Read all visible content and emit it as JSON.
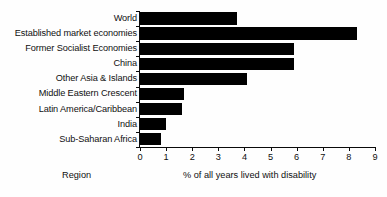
{
  "chart_data": {
    "type": "bar",
    "orientation": "horizontal",
    "title": "",
    "xlabel": "% of all years lived with disability",
    "ylabel": "Region",
    "categories": [
      "World",
      "Established market economies",
      "Former Socialist Economies",
      "China",
      "Other Asia & Islands",
      "Middle Eastern Crescent",
      "Latin America/Caribbean",
      "India",
      "Sub-Saharan Africa"
    ],
    "values": [
      3.7,
      8.3,
      5.9,
      5.9,
      4.1,
      1.7,
      1.6,
      1.0,
      0.8
    ],
    "xlim": [
      0,
      9
    ],
    "xticks": [
      0,
      1,
      2,
      3,
      4,
      5,
      6,
      7,
      8,
      9
    ],
    "xtick_labels": [
      "0",
      "1",
      "2",
      "3",
      "4",
      "5",
      "6",
      "7",
      "8",
      "9"
    ],
    "grid": false,
    "legend": null,
    "bar_color": "#000000",
    "background_color": "#ffffff",
    "axis_color": "#0a0a0a"
  }
}
